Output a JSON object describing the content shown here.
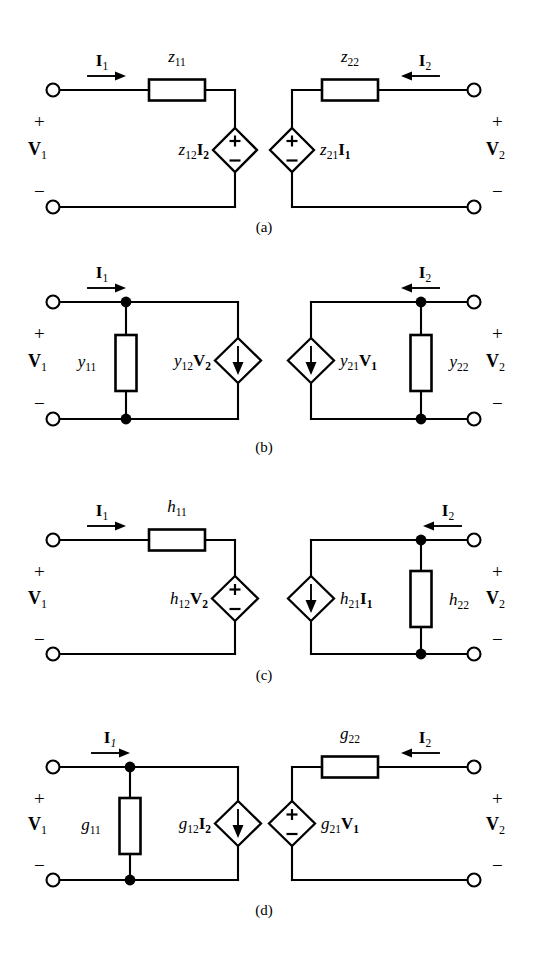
{
  "figure": {
    "panels": [
      {
        "id": "a",
        "caption": "(a)",
        "parameter_set": "z",
        "left_port": {
          "current_label": "I",
          "current_sub": "1",
          "voltage_label": "V",
          "voltage_sub": "1",
          "plus": "+",
          "minus": "−",
          "series_element": "z",
          "series_sub": "11",
          "source_label": "z",
          "source_sub": "12",
          "source_operand": "I",
          "source_operand_sub": "2",
          "source_type": "voltage-diamond",
          "source_plus": "+",
          "source_minus": "−"
        },
        "right_port": {
          "current_label": "I",
          "current_sub": "2",
          "voltage_label": "V",
          "voltage_sub": "2",
          "plus": "+",
          "minus": "−",
          "series_element": "z",
          "series_sub": "22",
          "source_label": "z",
          "source_sub": "21",
          "source_operand": "I",
          "source_operand_sub": "1",
          "source_type": "voltage-diamond",
          "source_plus": "+",
          "source_minus": "−"
        }
      },
      {
        "id": "b",
        "caption": "(b)",
        "parameter_set": "y",
        "left_port": {
          "current_label": "I",
          "current_sub": "1",
          "voltage_label": "V",
          "voltage_sub": "1",
          "plus": "+",
          "minus": "−",
          "shunt_element": "y",
          "shunt_sub": "11",
          "source_label": "y",
          "source_sub": "12",
          "source_operand": "V",
          "source_operand_sub": "2",
          "source_type": "current-diamond-down"
        },
        "right_port": {
          "current_label": "I",
          "current_sub": "2",
          "voltage_label": "V",
          "voltage_sub": "2",
          "plus": "+",
          "minus": "−",
          "shunt_element": "y",
          "shunt_sub": "22",
          "source_label": "y",
          "source_sub": "21",
          "source_operand": "V",
          "source_operand_sub": "1",
          "source_type": "current-diamond-down"
        }
      },
      {
        "id": "c",
        "caption": "(c)",
        "parameter_set": "h",
        "left_port": {
          "current_label": "I",
          "current_sub": "1",
          "voltage_label": "V",
          "voltage_sub": "1",
          "plus": "+",
          "minus": "−",
          "series_element": "h",
          "series_sub": "11",
          "source_label": "h",
          "source_sub": "12",
          "source_operand": "V",
          "source_operand_sub": "2",
          "source_type": "voltage-diamond",
          "source_plus": "+",
          "source_minus": "−"
        },
        "right_port": {
          "current_label": "I",
          "current_sub": "2",
          "voltage_label": "V",
          "voltage_sub": "2",
          "plus": "+",
          "minus": "−",
          "shunt_element": "h",
          "shunt_sub": "22",
          "source_label": "h",
          "source_sub": "21",
          "source_operand": "I",
          "source_operand_sub": "1",
          "source_type": "current-diamond-down"
        }
      },
      {
        "id": "d",
        "caption": "(d)",
        "parameter_set": "g",
        "left_port": {
          "current_label": "I",
          "current_sub": "1",
          "current_sub_italic": true,
          "voltage_label": "V",
          "voltage_sub": "1",
          "plus": "+",
          "minus": "−",
          "shunt_element": "g",
          "shunt_sub": "11",
          "source_label": "g",
          "source_sub": "12",
          "source_operand": "I",
          "source_operand_sub": "2",
          "source_type": "current-diamond-down"
        },
        "right_port": {
          "current_label": "I",
          "current_sub": "2",
          "voltage_label": "V",
          "voltage_sub": "2",
          "plus": "+",
          "minus": "−",
          "series_element": "g",
          "series_sub": "22",
          "source_label": "g",
          "source_sub": "21",
          "source_operand": "V",
          "source_operand_sub": "1",
          "source_type": "voltage-diamond",
          "source_plus": "+",
          "source_minus": "−"
        }
      }
    ]
  },
  "labels": {
    "a": {
      "caption": "(a)",
      "i1": "I",
      "i1s": "1",
      "i2": "I",
      "i2s": "2",
      "v1": "V",
      "v1s": "1",
      "v2": "V",
      "v2s": "2",
      "plus_l": "+",
      "minus_l": "−",
      "plus_r": "+",
      "minus_r": "−",
      "r_l": "z",
      "r_ls": "11",
      "r_r": "z",
      "r_rs": "22",
      "src_l_coef": "z",
      "src_l_coefs": "12",
      "src_l_var": "I",
      "src_l_vars": "2",
      "src_r_coef": "z",
      "src_r_coefs": "21",
      "src_r_var": "I",
      "src_r_vars": "1",
      "src_l_plus": "+",
      "src_l_minus": "−",
      "src_r_plus": "+",
      "src_r_minus": "−"
    },
    "b": {
      "caption": "(b)",
      "i1": "I",
      "i1s": "1",
      "i2": "I",
      "i2s": "2",
      "v1": "V",
      "v1s": "1",
      "v2": "V",
      "v2s": "2",
      "plus_l": "+",
      "minus_l": "−",
      "plus_r": "+",
      "minus_r": "−",
      "r_l": "y",
      "r_ls": "11",
      "r_r": "y",
      "r_rs": "22",
      "src_l_coef": "y",
      "src_l_coefs": "12",
      "src_l_var": "V",
      "src_l_vars": "2",
      "src_r_coef": "y",
      "src_r_coefs": "21",
      "src_r_var": "V",
      "src_r_vars": "1"
    },
    "c": {
      "caption": "(c)",
      "i1": "I",
      "i1s": "1",
      "i2": "I",
      "i2s": "2",
      "v1": "V",
      "v1s": "1",
      "v2": "V",
      "v2s": "2",
      "plus_l": "+",
      "minus_l": "−",
      "plus_r": "+",
      "minus_r": "−",
      "r_l": "h",
      "r_ls": "11",
      "r_r": "h",
      "r_rs": "22",
      "src_l_coef": "h",
      "src_l_coefs": "12",
      "src_l_var": "V",
      "src_l_vars": "2",
      "src_r_coef": "h",
      "src_r_coefs": "21",
      "src_r_var": "I",
      "src_r_vars": "1",
      "src_l_plus": "+",
      "src_l_minus": "−"
    },
    "d": {
      "caption": "(d)",
      "i1": "I",
      "i1s": "1",
      "i2": "I",
      "i2s": "2",
      "v1": "V",
      "v1s": "1",
      "v2": "V",
      "v2s": "2",
      "plus_l": "+",
      "minus_l": "−",
      "plus_r": "+",
      "minus_r": "−",
      "r_l": "g",
      "r_ls": "11",
      "r_r": "g",
      "r_rs": "22",
      "src_l_coef": "g",
      "src_l_coefs": "12",
      "src_l_var": "I",
      "src_l_vars": "2",
      "src_r_coef": "g",
      "src_r_coefs": "21",
      "src_r_var": "V",
      "src_r_vars": "1",
      "src_r_plus": "+",
      "src_r_minus": "−"
    }
  },
  "colors": {
    "ink": "#000000",
    "paper": "#ffffff"
  }
}
